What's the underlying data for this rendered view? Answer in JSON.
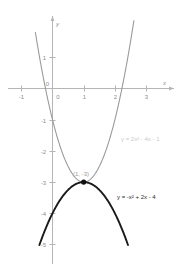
{
  "chart_data": {
    "type": "line",
    "title": "",
    "xlabel": "x",
    "ylabel": "y",
    "xlim": [
      -1.45,
      3.9
    ],
    "ylim": [
      -5.9,
      1.6
    ],
    "xticks": [
      -1,
      0,
      1,
      2,
      3
    ],
    "yticks": [
      1,
      0,
      -1,
      -2,
      -3,
      -4,
      -5
    ],
    "xtick_labels": [
      "-1",
      "0",
      "1",
      "2",
      "3"
    ],
    "ytick_labels": [
      "1",
      "0",
      "-1",
      "-2",
      "-3",
      "-4",
      "-5"
    ],
    "grid": false,
    "legend_position": "inline-annotations",
    "series": [
      {
        "name": "y = 2x² - 4x - 1",
        "label": "y = 2x² - 4x - 1",
        "color": "#9a9a9a",
        "type": "parabola",
        "a": 2,
        "b": -4,
        "c": -1,
        "vertex": [
          1,
          -3
        ],
        "y_intercept": -1,
        "opens": "up"
      },
      {
        "name": "y = -x² + 2x - 4",
        "label": "y = -x² + 2x - 4",
        "color": "#1a1a1a",
        "type": "parabola",
        "a": -1,
        "b": 2,
        "c": -4,
        "vertex": [
          1,
          -3
        ],
        "y_intercept": -4,
        "opens": "down"
      }
    ],
    "annotations": [
      {
        "name": "vertex-point",
        "text": "(1, -3)",
        "x": 1,
        "y": -3,
        "marker": "filled-circle",
        "color": "#111111"
      }
    ]
  },
  "labels": {
    "x_axis": "x",
    "y_axis": "y",
    "equation_gray": "y = 2x² - 4x - 1",
    "equation_black": "y = -x² + 2x - 4",
    "vertex_point": "(1, -3)",
    "xtick_neg1": "-1",
    "xtick_0": "0",
    "xtick_1": "1",
    "xtick_2": "2",
    "xtick_3": "3",
    "ytick_1": "1",
    "ytick_0": "0",
    "ytick_neg1": "-1",
    "ytick_neg2": "-2",
    "ytick_neg3": "-3",
    "ytick_neg4": "-4",
    "ytick_neg5": "-5"
  },
  "colors": {
    "axis": "#b5b5b5",
    "gray_curve": "#9a9a9a",
    "black_curve": "#1a1a1a",
    "tick_text": "#8d8d8d",
    "gray_equation_text": "#c9c9c9",
    "background": "#ffffff"
  }
}
